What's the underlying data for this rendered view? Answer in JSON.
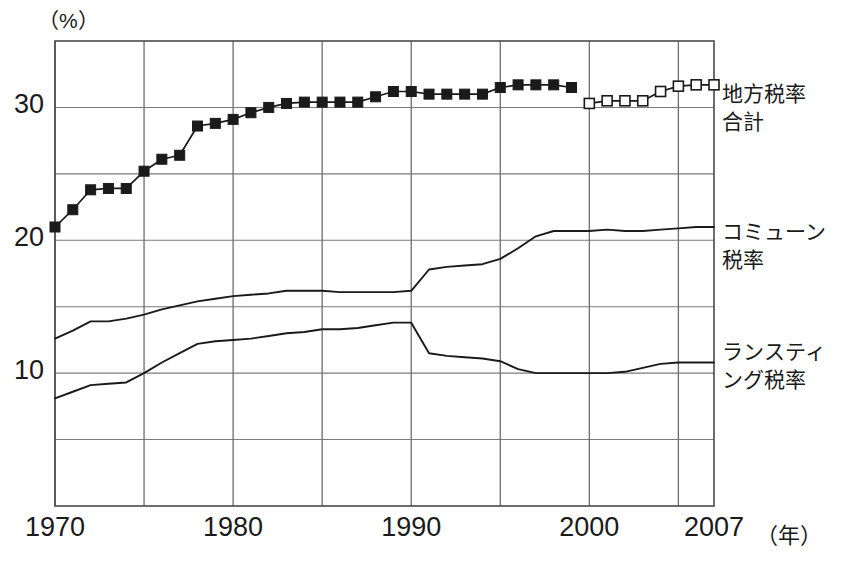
{
  "chart_data": {
    "type": "line",
    "title": "",
    "subtitle": "",
    "xlabel": "年",
    "ylabel": "(%)",
    "xlim": [
      1970,
      2007
    ],
    "ylim": [
      0,
      35
    ],
    "grid": true,
    "x_major_ticks": [
      1970,
      1980,
      1990,
      2000,
      2007
    ],
    "x_minor_gridlines": [
      1975,
      1985,
      1995,
      2005
    ],
    "y_gridlines": [
      5,
      10,
      15,
      20,
      25,
      30,
      35
    ],
    "y_tick_labels": [
      "30",
      "20",
      "10"
    ],
    "y_tick_values": [
      30,
      20,
      10
    ],
    "x_tick_labels": [
      "1970",
      "1980",
      "1990",
      "2000",
      "2007"
    ],
    "x_unit_label": "（年）",
    "y_unit_label": "（%）",
    "legend_position": "right-inline",
    "series": [
      {
        "name": "地方税率合計",
        "label_lines": [
          "地方税率",
          "合計"
        ],
        "marker": "filled-square",
        "color": "#1a1a1a",
        "x": [
          1970,
          1971,
          1972,
          1973,
          1974,
          1975,
          1976,
          1977,
          1978,
          1979,
          1980,
          1981,
          1982,
          1983,
          1984,
          1985,
          1986,
          1987,
          1988,
          1989,
          1990,
          1991,
          1992,
          1993,
          1994,
          1995,
          1996,
          1997,
          1998,
          1999
        ],
        "values": [
          21.0,
          22.3,
          23.8,
          23.9,
          23.9,
          25.2,
          26.1,
          26.4,
          28.6,
          28.8,
          29.1,
          29.6,
          30.0,
          30.3,
          30.4,
          30.4,
          30.4,
          30.4,
          30.8,
          31.2,
          31.2,
          31.0,
          31.0,
          31.0,
          31.0,
          31.5,
          31.7,
          31.7,
          31.7,
          31.5
        ]
      },
      {
        "name": "地方税率合計（新基準）",
        "label_lines": [],
        "marker": "open-square",
        "color": "#1a1a1a",
        "x": [
          2000,
          2001,
          2002,
          2003,
          2004,
          2005,
          2006,
          2007
        ],
        "values": [
          30.3,
          30.5,
          30.5,
          30.5,
          31.2,
          31.6,
          31.7,
          31.7
        ]
      },
      {
        "name": "コミューン税率",
        "label_lines": [
          "コミューン",
          "税率"
        ],
        "marker": "none",
        "color": "#1a1a1a",
        "x": [
          1970,
          1971,
          1972,
          1973,
          1974,
          1975,
          1976,
          1977,
          1978,
          1979,
          1980,
          1981,
          1982,
          1983,
          1984,
          1985,
          1986,
          1987,
          1988,
          1989,
          1990,
          1991,
          1992,
          1993,
          1994,
          1995,
          1996,
          1997,
          1998,
          1999,
          2000,
          2001,
          2002,
          2003,
          2004,
          2005,
          2006,
          2007
        ],
        "values": [
          12.6,
          13.2,
          13.9,
          13.9,
          14.1,
          14.4,
          14.8,
          15.1,
          15.4,
          15.6,
          15.8,
          15.9,
          16.0,
          16.2,
          16.2,
          16.2,
          16.1,
          16.1,
          16.1,
          16.1,
          16.2,
          17.8,
          18.0,
          18.1,
          18.2,
          18.6,
          19.4,
          20.3,
          20.7,
          20.7,
          20.7,
          20.8,
          20.7,
          20.7,
          20.8,
          20.9,
          21.0,
          21.0
        ]
      },
      {
        "name": "ランスティング税率",
        "label_lines": [
          "ランスティ",
          "ング税率"
        ],
        "marker": "none",
        "color": "#1a1a1a",
        "x": [
          1970,
          1971,
          1972,
          1973,
          1974,
          1975,
          1976,
          1977,
          1978,
          1979,
          1980,
          1981,
          1982,
          1983,
          1984,
          1985,
          1986,
          1987,
          1988,
          1989,
          1990,
          1991,
          1992,
          1993,
          1994,
          1995,
          1996,
          1997,
          1998,
          1999,
          2000,
          2001,
          2002,
          2003,
          2004,
          2005,
          2006,
          2007
        ],
        "values": [
          8.1,
          8.6,
          9.1,
          9.2,
          9.3,
          10.0,
          10.8,
          11.5,
          12.2,
          12.4,
          12.5,
          12.6,
          12.8,
          13.0,
          13.1,
          13.3,
          13.3,
          13.4,
          13.6,
          13.8,
          13.8,
          11.5,
          11.3,
          11.2,
          11.1,
          10.9,
          10.3,
          10.0,
          10.0,
          10.0,
          10.0,
          10.0,
          10.1,
          10.4,
          10.7,
          10.8,
          10.8,
          10.8
        ]
      }
    ]
  },
  "axis": {
    "y_unit": "（%）",
    "x_unit": "（年）"
  }
}
